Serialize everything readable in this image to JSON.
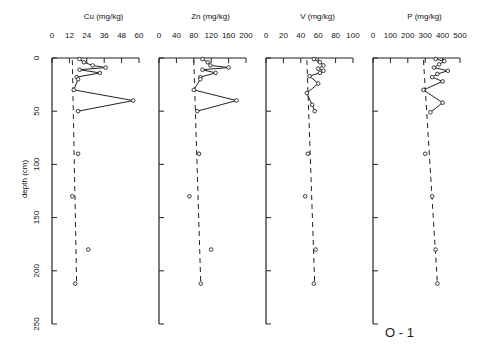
{
  "chart_data": {
    "type": "line",
    "figure_label": "O - 1",
    "ylabel": "depth (cm)",
    "ylim": [
      0,
      250
    ],
    "yticks": [
      0,
      50,
      100,
      150,
      200,
      250
    ],
    "grid": false,
    "panels": [
      {
        "title": "Cu (mg/kg)",
        "xlim": [
          0,
          60
        ],
        "xticks": [
          0,
          12,
          24,
          36,
          48,
          60
        ],
        "points": [
          {
            "x": 19,
            "y": 1
          },
          {
            "x": 22,
            "y": 4
          },
          {
            "x": 28,
            "y": 7
          },
          {
            "x": 37,
            "y": 9
          },
          {
            "x": 19,
            "y": 11
          },
          {
            "x": 33,
            "y": 14
          },
          {
            "x": 17,
            "y": 18
          },
          {
            "x": 18,
            "y": 20
          },
          {
            "x": 15,
            "y": 30
          },
          {
            "x": 56,
            "y": 40
          },
          {
            "x": 18,
            "y": 50
          },
          {
            "x": 18,
            "y": 90
          },
          {
            "x": 14,
            "y": 130
          },
          {
            "x": 25,
            "y": 180
          },
          {
            "x": 16,
            "y": 212
          }
        ],
        "solid_until": 11,
        "trend": [
          {
            "x": 14,
            "y": 2
          },
          {
            "x": 17,
            "y": 212
          }
        ]
      },
      {
        "title": "Zn (mg/kg)",
        "xlim": [
          0,
          200
        ],
        "xticks": [
          0,
          40,
          80,
          120,
          160,
          200
        ],
        "points": [
          {
            "x": 100,
            "y": 1
          },
          {
            "x": 112,
            "y": 4
          },
          {
            "x": 118,
            "y": 7
          },
          {
            "x": 160,
            "y": 9
          },
          {
            "x": 100,
            "y": 11
          },
          {
            "x": 130,
            "y": 14
          },
          {
            "x": 95,
            "y": 18
          },
          {
            "x": 95,
            "y": 20
          },
          {
            "x": 80,
            "y": 30
          },
          {
            "x": 178,
            "y": 40
          },
          {
            "x": 88,
            "y": 50
          },
          {
            "x": 92,
            "y": 90
          },
          {
            "x": 70,
            "y": 130
          },
          {
            "x": 120,
            "y": 180
          },
          {
            "x": 96,
            "y": 212
          }
        ],
        "solid_until": 11,
        "trend": [
          {
            "x": 80,
            "y": 2
          },
          {
            "x": 96,
            "y": 212
          }
        ]
      },
      {
        "title": "V (mg/kg)",
        "xlim": [
          0,
          100
        ],
        "xticks": [
          0,
          20,
          40,
          60,
          80,
          100
        ],
        "points": [
          {
            "x": 55,
            "y": 1
          },
          {
            "x": 62,
            "y": 4
          },
          {
            "x": 66,
            "y": 7
          },
          {
            "x": 60,
            "y": 10
          },
          {
            "x": 66,
            "y": 12
          },
          {
            "x": 62,
            "y": 14
          },
          {
            "x": 50,
            "y": 17
          },
          {
            "x": 60,
            "y": 24
          },
          {
            "x": 47,
            "y": 33
          },
          {
            "x": 53,
            "y": 44
          },
          {
            "x": 56,
            "y": 50
          },
          {
            "x": 48,
            "y": 90
          },
          {
            "x": 45,
            "y": 130
          },
          {
            "x": 57,
            "y": 180
          },
          {
            "x": 55,
            "y": 212
          }
        ],
        "solid_until": 11,
        "trend": [
          {
            "x": 47,
            "y": 2
          },
          {
            "x": 56,
            "y": 212
          }
        ]
      },
      {
        "title": "P (mg/kg)",
        "xlim": [
          0,
          500
        ],
        "xticks": [
          0,
          100,
          200,
          300,
          400,
          500
        ],
        "points": [
          {
            "x": 360,
            "y": 1
          },
          {
            "x": 410,
            "y": 3
          },
          {
            "x": 380,
            "y": 6
          },
          {
            "x": 350,
            "y": 9
          },
          {
            "x": 430,
            "y": 12
          },
          {
            "x": 370,
            "y": 15
          },
          {
            "x": 340,
            "y": 18
          },
          {
            "x": 400,
            "y": 22
          },
          {
            "x": 290,
            "y": 30
          },
          {
            "x": 400,
            "y": 42
          },
          {
            "x": 330,
            "y": 51
          },
          {
            "x": 300,
            "y": 90
          },
          {
            "x": 340,
            "y": 130
          },
          {
            "x": 360,
            "y": 180
          },
          {
            "x": 370,
            "y": 212
          }
        ],
        "solid_until": 11,
        "trend": [
          {
            "x": 290,
            "y": 2
          },
          {
            "x": 370,
            "y": 212
          }
        ]
      }
    ]
  }
}
